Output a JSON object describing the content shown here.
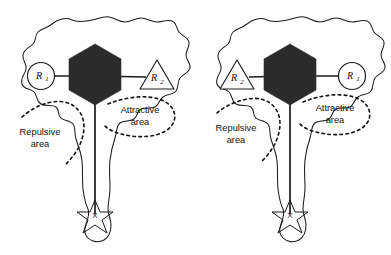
{
  "figure": {
    "type": "diagram",
    "background_color": "#ffffff",
    "outline_color": "#1b1b1b",
    "hexagon_color": "#2b2b2b",
    "dash_color": "#111111",
    "panel_count": 2
  },
  "panels": [
    {
      "id": "left-panel",
      "name": "left-configuration",
      "nodes": [
        {
          "id": "left-node-a",
          "label": "R",
          "subscript": "1",
          "shape": "circle",
          "side": "left",
          "x": 41,
          "y": 76
        },
        {
          "id": "left-node-b",
          "label": "R",
          "subscript": "2",
          "shape": "triangle",
          "side": "right",
          "x": 157,
          "y": 78
        },
        {
          "id": "left-hexagon",
          "label": "",
          "shape": "hexagon",
          "side": "center",
          "x": 95,
          "y": 75
        },
        {
          "id": "left-goal",
          "label": "X",
          "shape": "star",
          "side": "bottom",
          "x": 95,
          "y": 215
        }
      ],
      "annotations": [
        {
          "id": "left-repulsive",
          "line1": "Repulsive",
          "line2": "area",
          "x": 40,
          "y": 135,
          "curve": "dashed"
        },
        {
          "id": "left-attractive",
          "line1": "Attractive",
          "line2": "area",
          "x": 140,
          "y": 113,
          "curve": "dashed"
        }
      ]
    },
    {
      "id": "right-panel",
      "name": "right-configuration",
      "nodes": [
        {
          "id": "right-node-a",
          "label": "R",
          "subscript": "2",
          "shape": "triangle",
          "side": "left",
          "x": 237,
          "y": 78
        },
        {
          "id": "right-node-b",
          "label": "R",
          "subscript": "1",
          "shape": "circle",
          "side": "right",
          "x": 352,
          "y": 76
        },
        {
          "id": "right-hexagon",
          "label": "",
          "shape": "hexagon",
          "side": "center",
          "x": 290,
          "y": 75
        },
        {
          "id": "right-goal",
          "label": "X",
          "shape": "star",
          "side": "bottom",
          "x": 290,
          "y": 215
        }
      ],
      "annotations": [
        {
          "id": "right-repulsive",
          "line1": "Repulsive",
          "line2": "area",
          "x": 236,
          "y": 131,
          "curve": "dashed"
        },
        {
          "id": "right-attractive",
          "line1": "Attractive",
          "line2": "area",
          "x": 335,
          "y": 111,
          "curve": "dashed"
        }
      ]
    }
  ],
  "labels": {
    "r1": "R",
    "r1_sub": "1",
    "r2": "R",
    "r2_sub": "2",
    "repulsive_line1": "Repulsive",
    "repulsive_line2": "area",
    "attractive_line1": "Attractive",
    "attractive_line2": "area",
    "goal_marker": "X"
  }
}
